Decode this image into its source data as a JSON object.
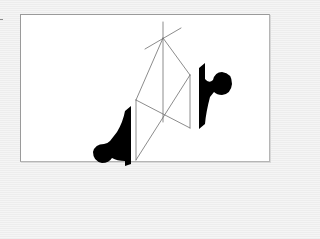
{
  "figure": {
    "description": "Two black profile silhouettes facing each other across a wireframe prism",
    "background_color": "#f3f3f3",
    "panel_color": "#ffffff",
    "line_color": "#6e6e6e",
    "silhouette_color": "#000000",
    "elements": [
      {
        "name": "wireframe-prism",
        "kind": "line-drawing"
      },
      {
        "name": "left-silhouette",
        "kind": "filled-shape",
        "position": "lower-left"
      },
      {
        "name": "right-silhouette",
        "kind": "filled-shape",
        "position": "upper-right"
      }
    ]
  }
}
